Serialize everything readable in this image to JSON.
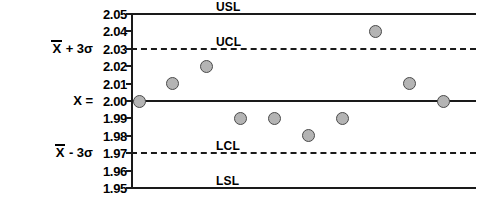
{
  "chart_data": {
    "type": "scatter",
    "title": "",
    "xlabel": "",
    "ylabel": "",
    "ylim": [
      1.95,
      2.05
    ],
    "grid": false,
    "legend": "none",
    "y_ticks": [
      "2.05",
      "2.04",
      "2.03",
      "2.02",
      "2.01",
      "2.00",
      "1.99",
      "1.98",
      "1.97",
      "1.96",
      "1.95"
    ],
    "y_tick_values": [
      2.05,
      2.04,
      2.03,
      2.02,
      2.01,
      2.0,
      1.99,
      1.98,
      1.97,
      1.96,
      1.95
    ],
    "reference_lines": [
      {
        "label": "USL",
        "value": 2.05,
        "style": "solid"
      },
      {
        "label": "UCL",
        "value": 2.03,
        "style": "dashed"
      },
      {
        "label": "",
        "value": 2.0,
        "style": "solid"
      },
      {
        "label": "LCL",
        "value": 1.97,
        "style": "dashed"
      },
      {
        "label": "LSL",
        "value": 1.95,
        "style": "solid"
      }
    ],
    "series": [
      {
        "name": "measurements",
        "marker": "circle",
        "marker_color": "#b4b4b4",
        "marker_edge_color": "#4a4a4a",
        "x": [
          1,
          2,
          3,
          4,
          5,
          6,
          7,
          8,
          9,
          10
        ],
        "values": [
          2.0,
          2.01,
          2.02,
          1.99,
          1.99,
          1.98,
          1.99,
          2.04,
          2.01,
          2.0
        ]
      }
    ]
  },
  "axis_labels": {
    "upper_sigma_pre": "X",
    "upper_sigma_post": " + 3σ",
    "center_label": "X =",
    "lower_sigma_pre": "X",
    "lower_sigma_post": " - 3σ"
  },
  "limit_labels": {
    "usl": "USL",
    "ucl": "UCL",
    "lcl": "LCL",
    "lsl": "LSL"
  }
}
